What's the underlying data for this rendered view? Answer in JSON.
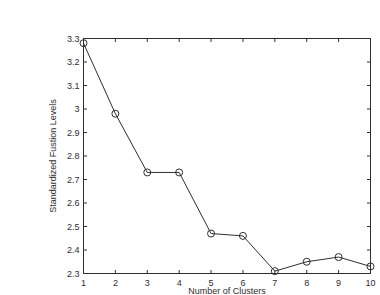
{
  "chart_data": {
    "type": "line",
    "x": [
      1,
      2,
      3,
      4,
      5,
      6,
      7,
      8,
      9,
      10
    ],
    "values": [
      3.28,
      2.98,
      2.73,
      2.73,
      2.47,
      2.46,
      2.31,
      2.35,
      2.37,
      2.33
    ],
    "title": "",
    "xlabel": "Number of Clusters",
    "ylabel": "Standardized Fustion Levels",
    "xlim": [
      1,
      10
    ],
    "ylim": [
      2.3,
      3.3
    ],
    "xticks": [
      1,
      2,
      3,
      4,
      5,
      6,
      7,
      8,
      9,
      10
    ],
    "xtick_labels": [
      "1",
      "2",
      "3",
      "4",
      "5",
      "6",
      "7",
      "8",
      "9",
      "10"
    ],
    "yticks": [
      2.3,
      2.4,
      2.5,
      2.6,
      2.7,
      2.8,
      2.9,
      3,
      3.1,
      3.2,
      3.3
    ],
    "ytick_labels": [
      "2.3",
      "2.4",
      "2.5",
      "2.6",
      "2.7",
      "2.8",
      "2.9",
      "3",
      "3.1",
      "3.2",
      "3.3"
    ],
    "grid": false,
    "legend_position": "none",
    "box": true,
    "marker": "circle-open",
    "marker_radius": 3.5,
    "line_color": "#2e2e2e",
    "axis_color": "#2e2e2e",
    "tick_label_color": "#2e2e2e",
    "background_color": "#ffffff"
  }
}
